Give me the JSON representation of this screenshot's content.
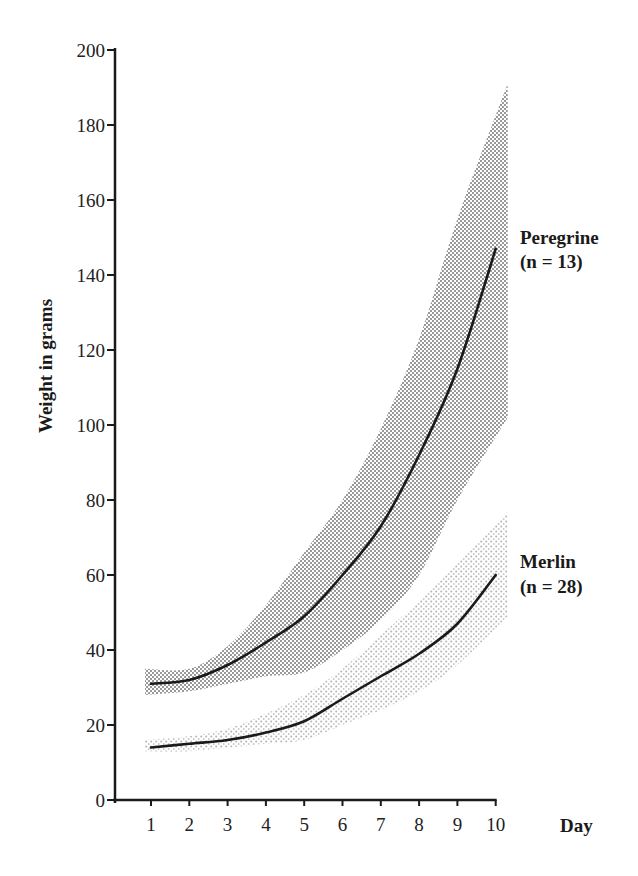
{
  "chart_data": {
    "type": "line",
    "title": "",
    "xlabel": "Day",
    "ylabel": "Weight in grams",
    "x": [
      1,
      2,
      3,
      4,
      5,
      6,
      7,
      8,
      9,
      10
    ],
    "x_ticks": [
      "1",
      "2",
      "3",
      "4",
      "5",
      "6",
      "7",
      "8",
      "9",
      "10"
    ],
    "y_ticks": [
      "0",
      "20",
      "40",
      "60",
      "80",
      "100",
      "120",
      "140",
      "160",
      "180",
      "200"
    ],
    "xlim": [
      0,
      10
    ],
    "ylim": [
      0,
      200
    ],
    "grid": false,
    "legend": "inline labels at right end of each curve",
    "series": [
      {
        "name": "Peregrine",
        "label_line1": "Peregrine",
        "label_line2": "(n = 13)",
        "n": 13,
        "values": [
          31,
          32,
          36,
          42,
          49,
          60,
          73,
          92,
          115,
          147
        ],
        "range_upper": [
          35,
          35,
          41,
          52,
          66,
          80,
          99,
          123,
          155,
          191
        ],
        "range_lower": [
          28,
          29,
          31,
          33,
          34,
          40,
          48,
          60,
          80,
          102
        ],
        "band_style": "dense dot screen"
      },
      {
        "name": "Merlin",
        "label_line1": "Merlin",
        "label_line2": "(n = 28)",
        "n": 28,
        "values": [
          14,
          15,
          16,
          18,
          21,
          27,
          33,
          39,
          47,
          60
        ],
        "range_upper": [
          16,
          17,
          19,
          23,
          28,
          35,
          44,
          53,
          63,
          77
        ],
        "range_lower": [
          13,
          13,
          14,
          15,
          16,
          20,
          24,
          29,
          36,
          49
        ],
        "band_style": "light stipple"
      }
    ]
  },
  "colors": {
    "line": "#1a1a1a",
    "peregrine_band": "#7a7a7a",
    "merlin_band": "#b8b8b8"
  }
}
